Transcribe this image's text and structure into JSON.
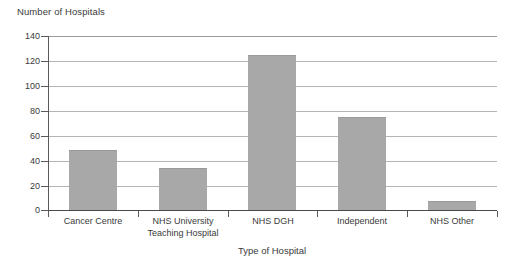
{
  "chart_data": {
    "type": "bar",
    "title": "",
    "subtitle": "",
    "ylabel": "Number of Hospitals",
    "xlabel": "Type of Hospital",
    "categories": [
      "Cancer Centre",
      "NHS University Teaching Hospital",
      "NHS DGH",
      "Independent",
      "NHS Other"
    ],
    "category_lines": [
      [
        "Cancer Centre"
      ],
      [
        "NHS University",
        "Teaching Hospital"
      ],
      [
        "NHS DGH"
      ],
      [
        "Independent"
      ],
      [
        "NHS Other"
      ]
    ],
    "values": [
      48,
      34,
      125,
      75,
      7
    ],
    "ylim": [
      0,
      140
    ],
    "ytick_step": 20,
    "yticks": [
      0,
      20,
      40,
      60,
      80,
      100,
      120,
      140
    ],
    "ytick_labels": [
      "0",
      "20",
      "40",
      "60",
      "80",
      "100",
      "120",
      "140"
    ],
    "grid": true,
    "grid_axis": "y",
    "legend": false,
    "legend_position": "none",
    "bar_color": "#a8a8a8",
    "grid_color": "#b4b4b4",
    "axis_color": "#4a4a4a",
    "text_color": "#3a3a3a"
  }
}
